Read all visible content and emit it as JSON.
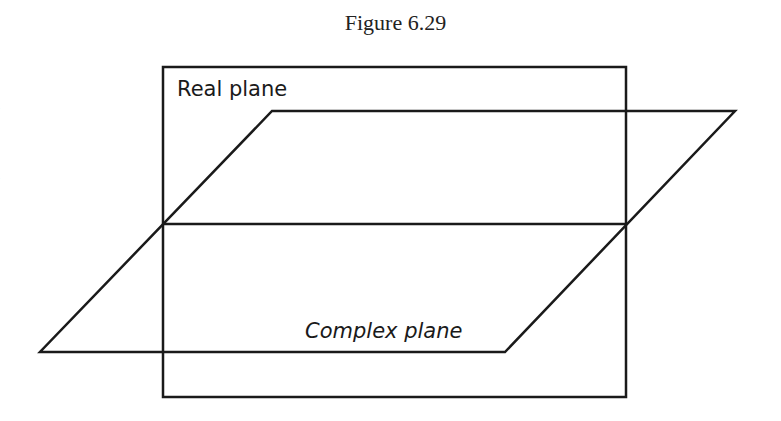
{
  "figure": {
    "caption": "Figure 6.29",
    "labels": {
      "real_plane": "Real plane",
      "complex_plane": "Complex plane"
    },
    "stroke_color": "#1a1a1a",
    "real_plane_rect": {
      "x": 163,
      "y": 67,
      "width": 463,
      "height": 330
    },
    "complex_plane_parallelogram": [
      [
        272,
        111
      ],
      [
        735,
        111
      ],
      [
        505,
        352
      ],
      [
        40,
        352
      ]
    ],
    "intersection_line": {
      "x1": 163,
      "x2": 626,
      "y": 224
    }
  },
  "margin_text": {
    "fragments": [
      "e",
      "e"
    ]
  }
}
